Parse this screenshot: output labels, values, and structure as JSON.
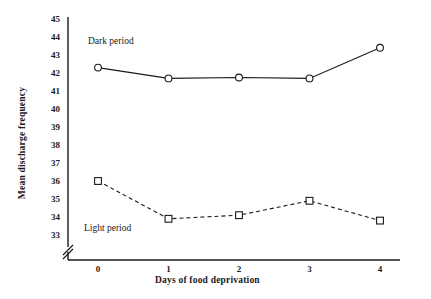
{
  "chart_data": {
    "type": "line",
    "title": "",
    "xlabel": "Days of food deprivation",
    "ylabel": "Mean discharge frequency",
    "x": [
      0,
      1,
      2,
      3,
      4
    ],
    "xticklabels": [
      "0",
      "1",
      "2",
      "3",
      "4"
    ],
    "xlim": [
      0,
      4
    ],
    "ylim": [
      33,
      45
    ],
    "yticks": [
      33,
      34,
      35,
      36,
      37,
      38,
      39,
      40,
      41,
      42,
      43,
      44,
      45
    ],
    "yticklabels": [
      "33",
      "34",
      "35",
      "36",
      "37",
      "38",
      "39",
      "40",
      "41",
      "42",
      "43",
      "44",
      "45"
    ],
    "grid": false,
    "legend_position": "inline-annotation",
    "axis_break": true,
    "series": [
      {
        "name": "Dark period",
        "marker": "open-circle",
        "linestyle": "solid",
        "color": "#1a1a1a",
        "values": [
          42.3,
          41.7,
          41.75,
          41.7,
          43.4
        ]
      },
      {
        "name": "Light period",
        "marker": "open-square",
        "linestyle": "dashed",
        "color": "#1a1a1a",
        "values": [
          36.0,
          33.9,
          34.1,
          34.9,
          33.8
        ]
      }
    ],
    "annotations": [
      {
        "text": "Dark period",
        "x": 0.45,
        "y": 43.7
      },
      {
        "text": "Light period",
        "x": 0.35,
        "y": 33.35
      }
    ]
  }
}
